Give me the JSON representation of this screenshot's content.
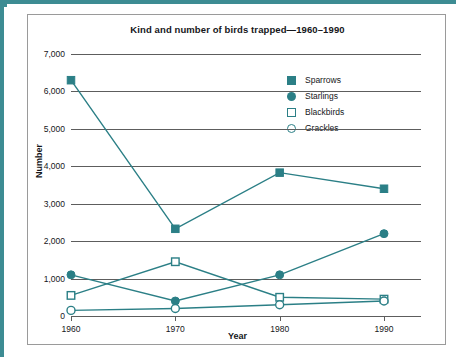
{
  "chart_data": {
    "type": "line",
    "title": "Kind and number of birds trapped—1960–1990",
    "xlabel": "Year",
    "ylabel": "Number",
    "categories": [
      "1960",
      "1970",
      "1980",
      "1990"
    ],
    "x": [
      1960,
      1970,
      1980,
      1990
    ],
    "ylim": [
      0,
      7000
    ],
    "yticks": [
      0,
      1000,
      2000,
      3000,
      4000,
      5000,
      6000,
      7000
    ],
    "ytick_labels": [
      "0",
      "1,000",
      "2,000",
      "3,000",
      "4,000",
      "5,000",
      "6,000",
      "7,000"
    ],
    "grid": true,
    "legend_position": "upper right",
    "series": [
      {
        "name": "Sparrows",
        "marker": "filled-square",
        "color": "#2b7f86",
        "values": [
          6300,
          2330,
          3830,
          3400
        ]
      },
      {
        "name": "Starlings",
        "marker": "filled-circle",
        "color": "#2b7f86",
        "values": [
          1100,
          400,
          1100,
          2200
        ]
      },
      {
        "name": "Blackbirds",
        "marker": "open-square",
        "color": "#2b7f86",
        "values": [
          550,
          1450,
          500,
          450
        ]
      },
      {
        "name": "Grackles",
        "marker": "open-circle",
        "color": "#2b7f86",
        "values": [
          150,
          200,
          300,
          400
        ]
      }
    ]
  },
  "colors": {
    "accent": "#2b7f86",
    "frame": "#3d8c93",
    "gridline": "#5d5d5d",
    "text": "#15161a",
    "card_border": "#9a9a9a",
    "background": "#ffffff"
  }
}
